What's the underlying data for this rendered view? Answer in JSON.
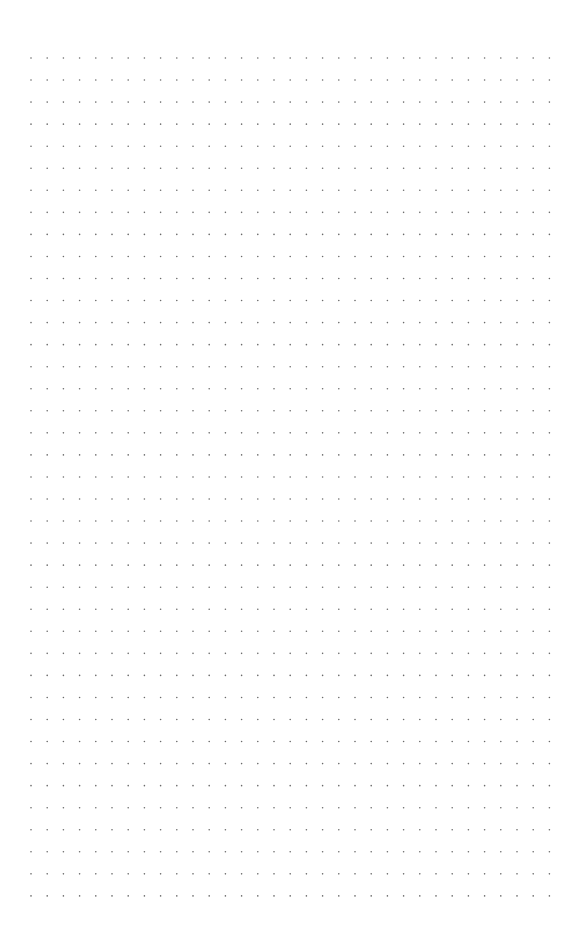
{
  "page": {
    "type": "dot-grid",
    "background": "#ffffff",
    "dot_color": "#6a6a6a",
    "dot_radius": 0.8,
    "grid": {
      "origin_x": 31,
      "origin_y": 58,
      "spacing_x": 16.2,
      "spacing_y": 22.05,
      "columns": 33,
      "rows": 39
    }
  }
}
